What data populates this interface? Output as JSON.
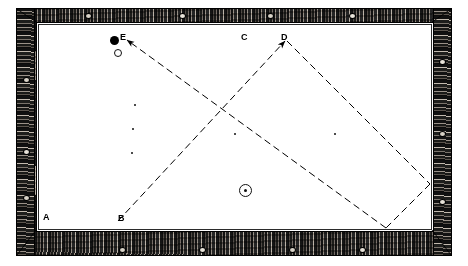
{
  "figure": {
    "type": "billiard-table-diagram",
    "table": {
      "frame_color": "#1a1a18",
      "cloth_color": "#ffffff",
      "line_color": "#000000",
      "bed": {
        "x": 36,
        "y": 22,
        "width": 396,
        "height": 208
      }
    },
    "labels": [
      {
        "id": "A",
        "text": "A",
        "x": 43,
        "y": 213,
        "note": "bottom-left corner reference"
      },
      {
        "id": "B",
        "text": "B",
        "x": 118,
        "y": 214,
        "note": "bottom cushion start point"
      },
      {
        "id": "C",
        "text": "C",
        "x": 241,
        "y": 33,
        "note": "top cushion reference"
      },
      {
        "id": "D",
        "text": "D",
        "x": 281,
        "y": 33,
        "note": "top cushion contact point"
      },
      {
        "id": "E",
        "text": "E",
        "x": 120,
        "y": 33,
        "note": "object ball position"
      }
    ],
    "balls": [
      {
        "name": "object-ball-black",
        "kind": "filled",
        "x": 110,
        "y": 36
      },
      {
        "name": "cue-ball-open",
        "kind": "open",
        "x": 114,
        "y": 49
      },
      {
        "name": "target-ball-spot",
        "kind": "ring",
        "x": 239,
        "y": 184
      }
    ],
    "spots": [
      {
        "x": 134,
        "y": 104
      },
      {
        "x": 132,
        "y": 128
      },
      {
        "x": 131,
        "y": 152
      },
      {
        "x": 234,
        "y": 133
      },
      {
        "x": 334,
        "y": 133
      }
    ],
    "paths": [
      {
        "name": "cue-path-b-to-d",
        "style": "dashed",
        "arrow_at": "end",
        "points": [
          [
            118,
            221
          ],
          [
            285,
            41
          ]
        ]
      },
      {
        "name": "rebound-path-d-to-right-cushion",
        "style": "dashed",
        "arrow_at": "none",
        "points": [
          [
            287,
            41
          ],
          [
            430,
            184
          ]
        ]
      },
      {
        "name": "rebound-path-cushion-to-bottom",
        "style": "dashed",
        "arrow_at": "none",
        "points": [
          [
            430,
            184
          ],
          [
            386,
            228
          ]
        ]
      },
      {
        "name": "return-path-to-e",
        "style": "dashed",
        "arrow_at": "end",
        "points": [
          [
            386,
            228
          ],
          [
            127,
            40
          ]
        ]
      }
    ],
    "frame_knots": [
      {
        "x": 24,
        "y": 78
      },
      {
        "x": 24,
        "y": 150
      },
      {
        "x": 24,
        "y": 196
      },
      {
        "x": 440,
        "y": 60
      },
      {
        "x": 440,
        "y": 132
      },
      {
        "x": 440,
        "y": 200
      },
      {
        "x": 86,
        "y": 14
      },
      {
        "x": 180,
        "y": 14
      },
      {
        "x": 268,
        "y": 14
      },
      {
        "x": 350,
        "y": 14
      },
      {
        "x": 120,
        "y": 248
      },
      {
        "x": 200,
        "y": 248
      },
      {
        "x": 290,
        "y": 248
      },
      {
        "x": 360,
        "y": 248
      }
    ]
  }
}
